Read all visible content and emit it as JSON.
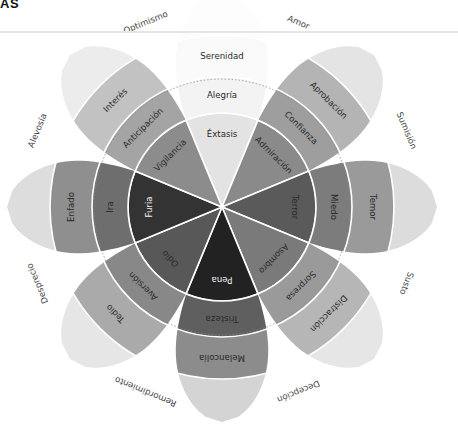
{
  "header": {
    "title_fragment": "AS"
  },
  "wheel": {
    "center": [
      222,
      207
    ],
    "radii": {
      "inner": 94,
      "middle": 130,
      "outer": 172,
      "tip": 215,
      "dotted_circle": 128
    },
    "petals": [
      {
        "angle": 0,
        "intense": "Éxtasis",
        "basic": "Alegría",
        "mild": "Serenidad",
        "colors": {
          "intense": "#e3e3e3",
          "basic": "#f3f3f3",
          "mild": "#fafafa",
          "tip": "#fdfdfd"
        }
      },
      {
        "angle": 45,
        "intense": "Admiración",
        "basic": "Confianza",
        "mild": "Aprobación",
        "colors": {
          "intense": "#8a8a8a",
          "basic": "#9e9e9e",
          "mild": "#b4b4b4",
          "tip": "#e4e4e4"
        }
      },
      {
        "angle": 90,
        "intense": "Terror",
        "basic": "Miedo",
        "mild": "Temor",
        "colors": {
          "intense": "#5a5a5a",
          "basic": "#7c7c7c",
          "mild": "#9a9a9a",
          "tip": "#dcdcdc"
        }
      },
      {
        "angle": 135,
        "intense": "Asombro",
        "basic": "Sorpresa",
        "mild": "Distracción",
        "colors": {
          "intense": "#7a7a7a",
          "basic": "#9a9a9a",
          "mild": "#b6b6b6",
          "tip": "#e6e6e6"
        }
      },
      {
        "angle": 180,
        "intense": "Pena",
        "basic": "Tristeza",
        "mild": "Melancolía",
        "colors": {
          "intense": "#222222",
          "basic": "#5f5f5f",
          "mild": "#8c8c8c",
          "tip": "#d4d4d4"
        }
      },
      {
        "angle": 225,
        "intense": "Odio",
        "basic": "Aversión",
        "mild": "Tedio",
        "colors": {
          "intense": "#585858",
          "basic": "#888888",
          "mild": "#aaaaaa",
          "tip": "#e6e6e6"
        }
      },
      {
        "angle": 270,
        "intense": "Furia",
        "basic": "Ira",
        "mild": "Enfado",
        "colors": {
          "intense": "#333333",
          "basic": "#6e6e6e",
          "mild": "#8f8f8f",
          "tip": "#dddddd"
        }
      },
      {
        "angle": 315,
        "intense": "Vigilancia",
        "basic": "Anticipación",
        "mild": "Interés",
        "colors": {
          "intense": "#8c8c8c",
          "basic": "#a4a4a4",
          "mild": "#c2c2c2",
          "tip": "#ececec"
        }
      }
    ],
    "dyads": [
      {
        "angle": 22.5,
        "label": "Amor"
      },
      {
        "angle": 67.5,
        "label": "Sumisión"
      },
      {
        "angle": 112.5,
        "label": "Susto"
      },
      {
        "angle": 157.5,
        "label": "Decepción"
      },
      {
        "angle": 202.5,
        "label": "Remordimiento"
      },
      {
        "angle": 247.5,
        "label": "Desprecio"
      },
      {
        "angle": 292.5,
        "label": "Alevosía"
      },
      {
        "angle": 337.5,
        "label": "Optimismo"
      }
    ],
    "dyad_radius": 200,
    "separator_color": "#ffffff",
    "top_line_y": 32
  }
}
